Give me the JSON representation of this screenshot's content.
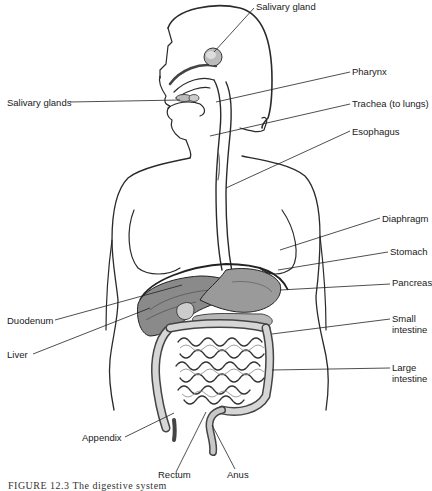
{
  "diagram": {
    "type": "anatomical-illustration",
    "labels": [
      {
        "id": "salivary-gland",
        "text": "Salivary gland"
      },
      {
        "id": "pharynx",
        "text": "Pharynx"
      },
      {
        "id": "salivary-glands",
        "text": "Salivary glands"
      },
      {
        "id": "trachea",
        "text": "Trachea (to lungs)"
      },
      {
        "id": "esophagus",
        "text": "Esophagus"
      },
      {
        "id": "diaphragm",
        "text": "Diaphragm"
      },
      {
        "id": "stomach",
        "text": "Stomach"
      },
      {
        "id": "pancreas",
        "text": "Pancreas"
      },
      {
        "id": "small-intestine",
        "text": "Small intestine",
        "line1": "Small",
        "line2": "intestine"
      },
      {
        "id": "large-intestine",
        "text": "Large intestine",
        "line1": "Large",
        "line2": "intestine"
      },
      {
        "id": "duodenum",
        "text": "Duodenum"
      },
      {
        "id": "liver",
        "text": "Liver"
      },
      {
        "id": "appendix",
        "text": "Appendix"
      },
      {
        "id": "rectum",
        "text": "Rectum"
      },
      {
        "id": "anus",
        "text": "Anus"
      }
    ],
    "caption": "FIGURE 12.3   The digestive system"
  }
}
